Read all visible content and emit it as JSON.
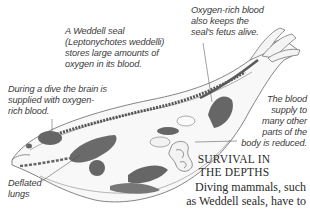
{
  "diagram": {
    "colors": {
      "outline": "#555555",
      "organ_dark": "#5f5f5f",
      "organ_mid": "#8a8a8a",
      "body_fill": "#f7f7f7",
      "text": "#3a3a3a"
    },
    "labels": {
      "seal_intro": [
        "A Weddell seal",
        "(Leptonychotes weddelli)",
        "stores large amounts of",
        "oxygen in its blood."
      ],
      "fetus": [
        "Oxygen-rich blood",
        "also keeps the",
        "seal's fetus alive."
      ],
      "brain": [
        "During a dive the brain is",
        "supplied with oxygen-",
        "rich blood."
      ],
      "blood_supply": [
        "The blood",
        "supply to",
        "many other",
        "parts of the",
        "body is reduced."
      ],
      "lungs": [
        "Deflated",
        "lungs"
      ]
    }
  },
  "section": {
    "heading_line1": "SURVIVAL IN",
    "heading_line2": "THE DEPTHS",
    "body_line1": "Diving mammals, such",
    "body_line2": "as Weddell seals, have to"
  }
}
